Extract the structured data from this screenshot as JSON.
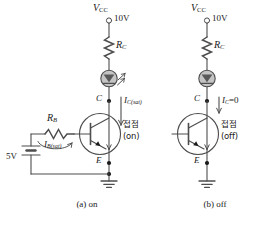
{
  "figure": {
    "panels": [
      {
        "id": "panel-a",
        "caption": "(a) on",
        "supply_label": "V",
        "supply_sub": "CC",
        "supply_value": "10V",
        "collector_resistor": "R",
        "collector_resistor_sub": "C",
        "led_name": "led-lit",
        "collector_node": "C",
        "emitter_node": "E",
        "collector_current": "I",
        "collector_current_sub": "C(sat)",
        "contact_korean": "접점",
        "contact_state": "(on)",
        "base_resistor": "R",
        "base_resistor_sub": "B",
        "base_current": "I",
        "base_current_sub": "B(sat)",
        "battery_value": "5V"
      },
      {
        "id": "panel-b",
        "caption": "(b) off",
        "supply_label": "V",
        "supply_sub": "CC",
        "supply_value": "10V",
        "collector_resistor": "R",
        "collector_resistor_sub": "C",
        "led_name": "led-unlit",
        "collector_node": "C",
        "emitter_node": "E",
        "collector_current": "I",
        "collector_current_sub": "C",
        "collector_current_value": "=0",
        "contact_korean": "접점",
        "contact_state": "(off)"
      }
    ],
    "colors": {
      "wire": "#4d4d4d",
      "text": "#1a1a1a",
      "led_fill": "#b3b3b3",
      "led_stroke": "#4d4d4d",
      "background": "#ffffff"
    }
  }
}
